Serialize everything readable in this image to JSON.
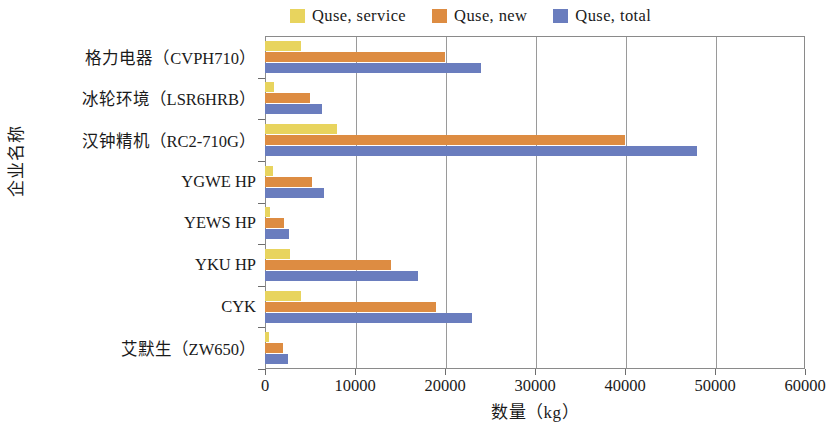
{
  "chart_data": {
    "type": "bar",
    "orientation": "horizontal",
    "title": "",
    "xlabel": "数量（kg）",
    "ylabel": "企业名称",
    "xlim": [
      0,
      60000
    ],
    "xticks": [
      0,
      10000,
      20000,
      30000,
      40000,
      50000,
      60000
    ],
    "xtick_labels": [
      "0",
      "10000",
      "20000",
      "30000",
      "40000",
      "50000",
      "60000"
    ],
    "grid": true,
    "grid_axis": "x",
    "legend_position": "top",
    "categories": [
      "格力电器（CVPH710）",
      "冰轮环境（LSR6HRB）",
      "汉钟精机（RC2-710G）",
      "YGWE HP",
      "YEWS HP",
      "YKU HP",
      "CYK",
      "艾默生（ZW650）"
    ],
    "series": [
      {
        "name": "Quse, service",
        "color": "#e8d45e",
        "values": [
          4000,
          1000,
          8000,
          900,
          600,
          2800,
          4000,
          400
        ]
      },
      {
        "name": "Quse, new",
        "color": "#dd8c42",
        "values": [
          20000,
          5000,
          40000,
          5200,
          2100,
          14000,
          19000,
          2000
        ]
      },
      {
        "name": "Quse, total",
        "color": "#6a7dbe",
        "values": [
          24000,
          6300,
          48000,
          6500,
          2700,
          17000,
          23000,
          2600
        ]
      }
    ]
  }
}
